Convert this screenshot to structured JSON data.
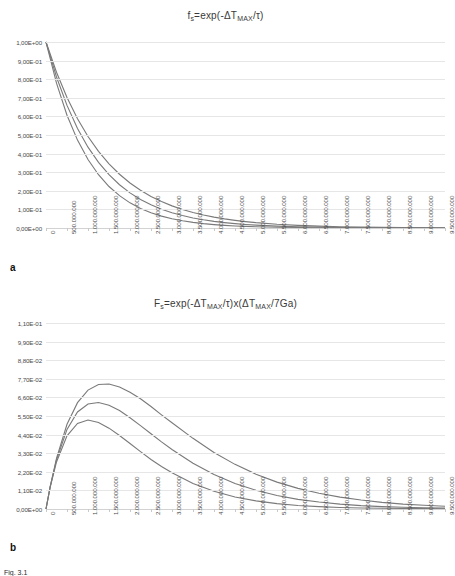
{
  "figure": {
    "caption": "Fig. 3.1",
    "panel_a_letter": "a",
    "panel_b_letter": "b"
  },
  "chart_data": [
    {
      "id": "panel-a",
      "type": "line",
      "title": "fs=exp(-ΔTMAX/τ)",
      "title_parts": {
        "lead": "f",
        "lead_sub": "s",
        "mid": "=exp(-ΔT",
        "mid_sub": "MAX",
        "tail": "/τ)"
      },
      "xlabel": "",
      "ylabel": "",
      "grid": true,
      "legend": "none",
      "xlim": [
        0,
        9500000000
      ],
      "ylim": [
        0.0,
        1.0
      ],
      "ytick_labels": [
        "0,00E+00",
        "1,00E-01",
        "2,00E-01",
        "3,00E-01",
        "4,00E-01",
        "5,00E-01",
        "6,00E-01",
        "7,00E-01",
        "8,00E-01",
        "9,00E-01",
        "1,00E+00"
      ],
      "ytick_values": [
        0.0,
        0.1,
        0.2,
        0.3,
        0.4,
        0.5,
        0.6,
        0.7,
        0.8,
        0.9,
        1.0
      ],
      "xtick_labels": [
        "0",
        "500.000.000",
        "1.000.000.000",
        "1.500.000.000",
        "2.000.000.000",
        "2.500.000.000",
        "3.000.000.000",
        "3.500.000.000",
        "4.000.000.000",
        "4.500.000.000",
        "5.000.000.000",
        "5.500.000.000",
        "6.000.000.000",
        "6.500.000.000",
        "7.000.000.000",
        "7.500.000.000",
        "8.000.000.000",
        "8.500.000.000",
        "9.000.000.000",
        "9.500.000.000"
      ],
      "xtick_values": [
        0,
        500000000,
        1000000000,
        1500000000,
        2000000000,
        2500000000,
        3000000000,
        3500000000,
        4000000000,
        4500000000,
        5000000000,
        5500000000,
        6000000000,
        6500000000,
        7000000000,
        7500000000,
        8000000000,
        8500000000,
        9000000000,
        9500000000
      ],
      "x": [
        0,
        250000000,
        500000000,
        750000000,
        1000000000,
        1250000000,
        1500000000,
        1750000000,
        2000000000,
        2250000000,
        2500000000,
        2750000000,
        3000000000,
        3250000000,
        3500000000,
        3750000000,
        4000000000,
        4250000000,
        4500000000,
        4750000000,
        5000000000,
        5500000000,
        6000000000,
        6500000000,
        7000000000,
        7500000000,
        8000000000,
        8500000000,
        9000000000,
        9500000000
      ],
      "series": [
        {
          "name": "tau-long",
          "color": "#7a7a7a",
          "tau": 1400000000,
          "values": [
            1.0,
            0.8375,
            0.7014,
            0.5874,
            0.4919,
            0.412,
            0.345,
            0.2889,
            0.242,
            0.2027,
            0.1697,
            0.1421,
            0.119,
            0.0997,
            0.0835,
            0.0699,
            0.0585,
            0.049,
            0.0411,
            0.0344,
            0.0288,
            0.0202,
            0.0142,
            0.01,
            0.007,
            0.0049,
            0.0034,
            0.0024,
            0.0017,
            0.0012
          ]
        },
        {
          "name": "tau-mid",
          "color": "#7a7a7a",
          "tau": 1200000000,
          "values": [
            1.0,
            0.8117,
            0.6592,
            0.5353,
            0.4346,
            0.353,
            0.2865,
            0.2327,
            0.1889,
            0.1534,
            0.1245,
            0.1011,
            0.0821,
            0.0667,
            0.0541,
            0.044,
            0.0357,
            0.029,
            0.0235,
            0.0191,
            0.0155,
            0.0102,
            0.0067,
            0.0045,
            0.0029,
            0.0019,
            0.0013,
            0.0008,
            0.0006,
            0.0004
          ]
        },
        {
          "name": "tau-short",
          "color": "#7a7a7a",
          "tau": 1000000000,
          "values": [
            1.0,
            0.7788,
            0.6065,
            0.4724,
            0.3679,
            0.2865,
            0.2231,
            0.1738,
            0.1353,
            0.1054,
            0.0821,
            0.0639,
            0.0498,
            0.0388,
            0.0302,
            0.0235,
            0.0183,
            0.0143,
            0.0111,
            0.0087,
            0.0067,
            0.0041,
            0.0025,
            0.0015,
            0.0009,
            0.0006,
            0.0003,
            0.0002,
            0.0001,
            0.0001
          ]
        }
      ]
    },
    {
      "id": "panel-b",
      "type": "line",
      "title": "Fs=exp(-ΔTMAX/τ)x(ΔTMAX/7Ga)",
      "title_parts": {
        "lead": "F",
        "lead_sub": "s",
        "mid": "=exp(-ΔT",
        "mid_sub": "MAX",
        "tail": "/τ)x(ΔT",
        "tail_sub": "MAX",
        "end": "/7Ga)"
      },
      "xlabel": "",
      "ylabel": "",
      "grid": true,
      "legend": "none",
      "xlim": [
        0,
        9500000000
      ],
      "ylim": [
        0.0,
        0.11
      ],
      "ytick_labels": [
        "0,00E+00",
        "1,10E-02",
        "2,20E-02",
        "3,30E-02",
        "4,40E-02",
        "5,50E-02",
        "6,60E-02",
        "7,70E-02",
        "8,80E-02",
        "9,90E-02",
        "1,10E-01"
      ],
      "ytick_values": [
        0.0,
        0.011,
        0.022,
        0.033,
        0.044,
        0.055,
        0.066,
        0.077,
        0.088,
        0.099,
        0.11
      ],
      "xtick_labels": [
        "0",
        "500.000.000",
        "1.000.000.000",
        "1.500.000.000",
        "2.000.000.000",
        "2.500.000.000",
        "3.000.000.000",
        "3.500.000.000",
        "4.000.000.000",
        "4.500.000.000",
        "5.000.000.000",
        "5.500.000.000",
        "6.000.000.000",
        "6.500.000.000",
        "7.000.000.000",
        "7.500.000.000",
        "8.000.000.000",
        "8.500.000.000",
        "9.000.000.000",
        "9.500.000.000"
      ],
      "xtick_values": [
        0,
        500000000,
        1000000000,
        1500000000,
        2000000000,
        2500000000,
        3000000000,
        3500000000,
        4000000000,
        4500000000,
        5000000000,
        5500000000,
        6000000000,
        6500000000,
        7000000000,
        7500000000,
        8000000000,
        8500000000,
        9000000000,
        9500000000
      ],
      "x": [
        0,
        100000000,
        250000000,
        500000000,
        750000000,
        1000000000,
        1250000000,
        1500000000,
        1750000000,
        2000000000,
        2250000000,
        2500000000,
        2750000000,
        3000000000,
        3500000000,
        4000000000,
        4500000000,
        5000000000,
        5500000000,
        6000000000,
        6500000000,
        7000000000,
        7500000000,
        8000000000,
        8500000000,
        9000000000,
        9500000000
      ],
      "series": [
        {
          "name": "tau-long",
          "color": "#7a7a7a",
          "tau": 1400000000,
          "peak_x": 1400000000,
          "peak_y": 0.0736,
          "values": [
            0.0,
            0.0133,
            0.0299,
            0.0501,
            0.0629,
            0.0703,
            0.0736,
            0.0739,
            0.0722,
            0.0691,
            0.0652,
            0.0606,
            0.0557,
            0.051,
            0.0418,
            0.0334,
            0.0264,
            0.0206,
            0.0159,
            0.0122,
            0.0093,
            0.007,
            0.0053,
            0.0039,
            0.0029,
            0.0022,
            0.0016
          ]
        },
        {
          "name": "tau-mid",
          "color": "#7a7a7a",
          "tau": 1200000000,
          "peak_x": 1200000000,
          "peak_y": 0.0631,
          "values": [
            0.0,
            0.0132,
            0.029,
            0.0471,
            0.0574,
            0.0621,
            0.063,
            0.0614,
            0.0582,
            0.054,
            0.0493,
            0.0445,
            0.0397,
            0.0352,
            0.0271,
            0.0204,
            0.0151,
            0.0111,
            0.008,
            0.0057,
            0.0041,
            0.0029,
            0.002,
            0.0014,
            0.001,
            0.0007,
            0.0005
          ]
        },
        {
          "name": "tau-short",
          "color": "#7a7a7a",
          "tau": 1000000000,
          "peak_x": 1000000000,
          "peak_y": 0.0525,
          "values": [
            0.0,
            0.0129,
            0.0278,
            0.0433,
            0.0506,
            0.0526,
            0.0512,
            0.0478,
            0.0435,
            0.0387,
            0.0339,
            0.0293,
            0.0251,
            0.0214,
            0.0151,
            0.0105,
            0.0071,
            0.0048,
            0.0032,
            0.0021,
            0.0014,
            0.0009,
            0.0006,
            0.0004,
            0.0003,
            0.0002,
            0.0001
          ]
        }
      ]
    }
  ]
}
